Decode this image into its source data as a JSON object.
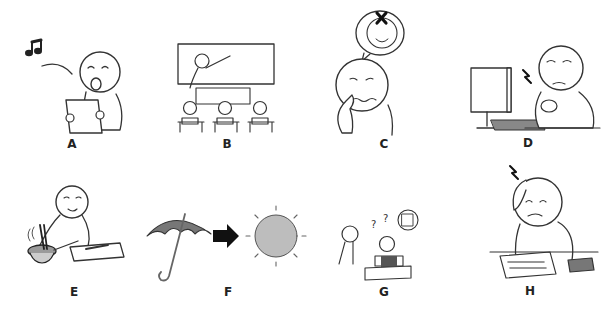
{
  "worksheet": {
    "panels": [
      {
        "id": "A",
        "label": "A",
        "scene": "person singing from a sheet of paper",
        "icons": [
          "music-note-icon",
          "paper-sheet-icon"
        ]
      },
      {
        "id": "B",
        "label": "B",
        "scene": "teacher pointing at blackboard in front of three students at desks",
        "icons": [
          "blackboard-icon",
          "desk-icon"
        ]
      },
      {
        "id": "C",
        "label": "C",
        "scene": "worried person touching nose, thought bubble with crossed-out smiling face",
        "icons": [
          "thought-bubble-icon",
          "cross-icon"
        ]
      },
      {
        "id": "D",
        "label": "D",
        "scene": "person at computer holding aching wrist",
        "icons": [
          "monitor-icon",
          "keyboard-icon",
          "pain-bolt-icon"
        ]
      },
      {
        "id": "E",
        "label": "E",
        "scene": "smiling person cooking, stirring steaming bowl with chopsticks next to cutting board",
        "icons": [
          "bowl-icon",
          "chopsticks-icon",
          "cutting-board-icon"
        ]
      },
      {
        "id": "F",
        "label": "F",
        "scene": "umbrella changing to sun (rain turns to sunshine)",
        "icons": [
          "umbrella-icon",
          "arrow-right-icon",
          "sun-icon"
        ]
      },
      {
        "id": "G",
        "label": "G",
        "scene": "confused student reading a book at desk with question marks, another person watching",
        "icons": [
          "question-mark-icon",
          "book-icon",
          "thought-bubble-icon"
        ]
      },
      {
        "id": "H",
        "label": "H",
        "scene": "stressed person scratching head over papers with a book nearby",
        "icons": [
          "pain-bolt-icon",
          "papers-icon",
          "book-icon"
        ]
      }
    ],
    "bubble_text_g": "???"
  },
  "colors": {
    "ink": "#222222",
    "umbrella": "#777777",
    "sun": "#bdbdbd",
    "background": "#ffffff"
  }
}
